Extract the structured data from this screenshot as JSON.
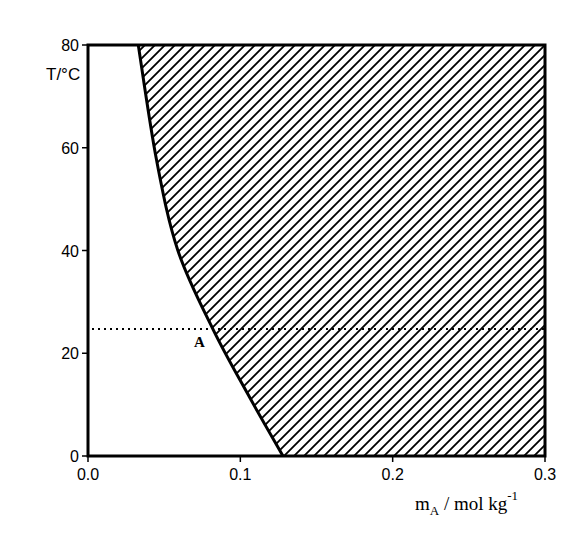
{
  "chart_data": {
    "type": "area",
    "title": "",
    "xlabel": "m_A / mol kg^-1",
    "xlabel_parts": {
      "main": "m",
      "subscript": "A",
      "unit": " / mol kg",
      "superscript": "-1"
    },
    "ylabel": "T/°C",
    "xlim": [
      0.0,
      0.3
    ],
    "ylim": [
      0,
      80
    ],
    "x_ticks": [
      0.0,
      0.1,
      0.2,
      0.3
    ],
    "x_tick_labels": [
      "0.0",
      "0.1",
      "0.2",
      "0.3"
    ],
    "y_ticks": [
      0,
      20,
      40,
      60,
      80
    ],
    "y_tick_labels": [
      "0",
      "20",
      "40",
      "60",
      "80"
    ],
    "grid": false,
    "legend": null,
    "series": [
      {
        "name": "solubility boundary",
        "style": "solid",
        "points": [
          {
            "x": 0.128,
            "y": 0
          },
          {
            "x": 0.105,
            "y": 12
          },
          {
            "x": 0.082,
            "y": 24.7
          },
          {
            "x": 0.059,
            "y": 40
          },
          {
            "x": 0.045,
            "y": 57.6
          },
          {
            "x": 0.033,
            "y": 80
          }
        ]
      }
    ],
    "shaded_region": {
      "description": "hatched region to the right of the boundary curve",
      "pattern": "diagonal-hatch",
      "x_from": "curve",
      "x_to": 0.3,
      "y_range": [
        0,
        80
      ]
    },
    "reference_line": {
      "orientation": "horizontal",
      "style": "dotted",
      "y": 24.7,
      "x_range": [
        0.0,
        0.3
      ]
    },
    "annotations": [
      {
        "text": "A",
        "x": 0.082,
        "y": 24.7,
        "position": "below-left of intersection"
      }
    ]
  },
  "labels": {
    "y_axis": "T/°C",
    "x_axis_main": "m",
    "x_axis_sub": "A",
    "x_axis_unit": " / mol kg",
    "x_axis_sup": "-1",
    "point_a": "A"
  },
  "colors": {
    "ink": "#000000",
    "background": "#ffffff"
  }
}
